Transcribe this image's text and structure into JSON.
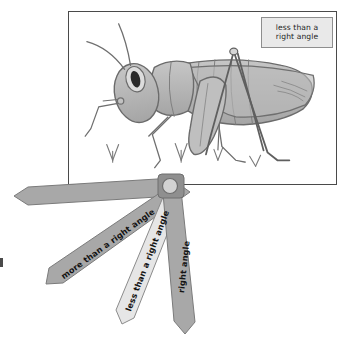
{
  "page": {
    "background_color": "#ffffff"
  },
  "photo": {
    "name": "grasshopper-drawing",
    "description": "Hand-drawn shaded grasshopper standing on grass, facing left, with a raised hind leg forming a narrow A-shape angle",
    "frame_border_color": "#4a4a4a",
    "fill_color": "#b4b4b4",
    "outline_color": "#6b6b6b"
  },
  "callout": {
    "name": "angle-label-callout",
    "line1": "less than a",
    "line2": "right angle",
    "background_color": "#e9e9e9",
    "border_color": "#8e8e8e"
  },
  "fan": {
    "name": "angle-fan-tool",
    "pivot_color": "#d2d2d2",
    "pivot_body_color": "#8f8f8f",
    "strips": [
      {
        "name": "fan-strip-blank",
        "label": "",
        "color": "#a8a8a8",
        "angle_deg": 188
      },
      {
        "name": "fan-strip-more-than-right-angle",
        "label": "more than a right angle",
        "color": "#a8a8a8",
        "angle_deg": 143
      },
      {
        "name": "fan-strip-less-than-right-angle",
        "label": "less than a right angle",
        "color": "#e4e4e4",
        "angle_deg": 109
      },
      {
        "name": "fan-strip-right-angle",
        "label": "right angle",
        "color": "#a8a8a8",
        "angle_deg": 96
      }
    ]
  }
}
